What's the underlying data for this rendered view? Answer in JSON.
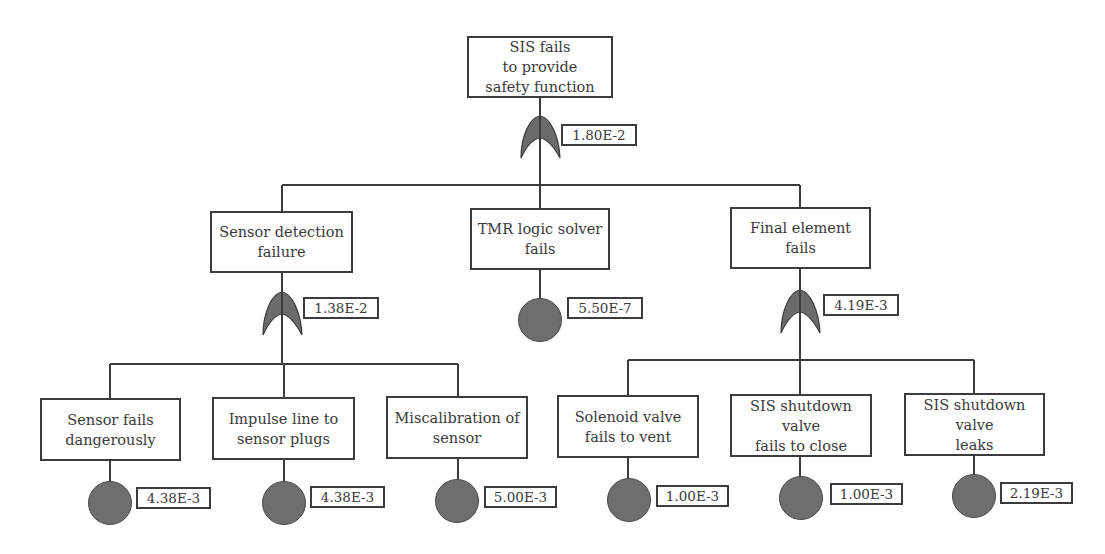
{
  "diagram": {
    "type": "fault-tree",
    "colors": {
      "line": "#3c3c3c",
      "gate_fill": "#6b6b6b",
      "basic_fill": "#6e6e6e",
      "background": "#ffffff"
    },
    "top_event": {
      "label": "SIS fails\nto provide\nsafety function",
      "gate": "OR",
      "probability": "1.80E-2"
    },
    "intermediate": [
      {
        "label": "Sensor detection\nfailure",
        "gate": "OR",
        "probability": "1.38E-2"
      },
      {
        "label": "TMR logic solver\nfails",
        "gate": "basic",
        "probability": "5.50E-7"
      },
      {
        "label": "Final element fails",
        "gate": "OR",
        "probability": "4.19E-3"
      }
    ],
    "sensor_children": [
      {
        "label": "Sensor fails\ndangerously",
        "probability": "4.38E-3"
      },
      {
        "label": "Impulse line to\nsensor plugs",
        "probability": "4.38E-3"
      },
      {
        "label": "Miscalibration of\nsensor",
        "probability": "5.00E-3"
      }
    ],
    "final_element_children": [
      {
        "label": "Solenoid valve\nfails to vent",
        "probability": "1.00E-3"
      },
      {
        "label": "SIS shutdown valve\nfails to close",
        "probability": "1.00E-3"
      },
      {
        "label": "SIS shutdown valve\nleaks",
        "probability": "2.19E-3"
      }
    ]
  }
}
